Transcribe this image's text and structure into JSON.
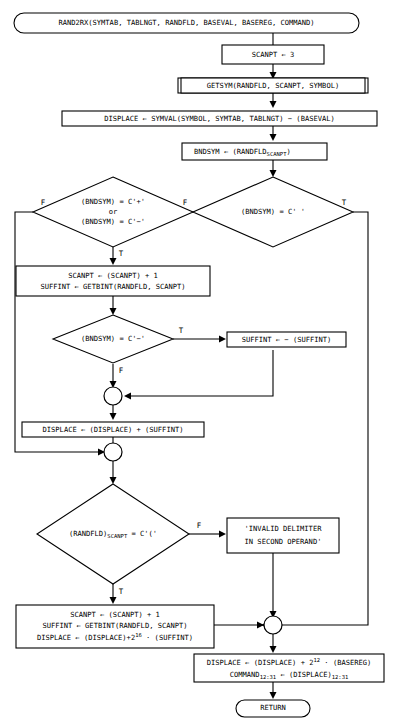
{
  "diagram": {
    "colors": {
      "stroke": "#000000",
      "fill": "#ffffff",
      "background": "#ffffff"
    }
  },
  "nodes": {
    "start": {
      "type": "terminator",
      "text": "RAND2RX(SYMTAB, TABLNGT, RANDFLD, BASEVAL, BASEREG, COMMAND)"
    },
    "scanpt_init": {
      "type": "process",
      "text": "SCANPT ← 3"
    },
    "getsym": {
      "type": "subroutine",
      "text": "GETSYM(RANDFLD, SCANPT, SYMBOL)"
    },
    "displace_symval": {
      "type": "process",
      "text": "DISPLACE ← SYMVAL(SYMBOL, SYMTAB, TABLNGT) − (BASEVAL)"
    },
    "bndsym_assign": {
      "type": "process",
      "text_main": "BNDSYM ← (RANDFLD",
      "text_sub": "SCANPT",
      "text_tail": ")"
    },
    "decision_blank": {
      "type": "decision",
      "text": "(BNDSYM) = C' '",
      "true_label": "T",
      "false_label": "F"
    },
    "decision_plusminus": {
      "type": "decision",
      "line1": "(BNDSYM) = C'+'",
      "line2": "or",
      "line3": "(BNDSYM) = C'−'",
      "true_label": "T",
      "false_label": "F"
    },
    "scanpt_suffint": {
      "type": "process",
      "line1": "SCANPT ← (SCANPT) + 1",
      "line2": "SUFFINT ← GETBINT(RANDFLD, SCANPT)"
    },
    "decision_minus": {
      "type": "decision",
      "text": "(BNDSYM) = C'−'",
      "true_label": "T",
      "false_label": "F"
    },
    "suffint_negate": {
      "type": "process",
      "text": "SUFFINT ← − (SUFFINT)"
    },
    "connector_1": {
      "type": "connector"
    },
    "displace_add_suffint": {
      "type": "process",
      "text": "DISPLACE ← (DISPLACE) + (SUFFINT)"
    },
    "connector_2": {
      "type": "connector"
    },
    "decision_paren": {
      "type": "decision",
      "text_main": "(RANDFLD)",
      "text_sub": "SCANPT",
      "text_tail": " = C'('",
      "true_label": "T",
      "false_label": "F"
    },
    "error_msg": {
      "type": "process",
      "line1": "'INVALID DELIMITER",
      "line2": "IN SECOND OPERAND'"
    },
    "scanpt_displace": {
      "type": "process",
      "line1": "SCANPT ← (SCANPT) + 1",
      "line2": "SUFFINT ← GETBINT(RANDFLD, SCANPT)",
      "line3_a": "DISPLACE ← (DISPLACE)+2",
      "line3_sup": "16",
      "line3_b": " · (SUFFINT)"
    },
    "connector_3": {
      "type": "connector"
    },
    "final_displace": {
      "type": "process",
      "line1_a": "DISPLACE ← (DISPLACE) + 2",
      "line1_sup": "12",
      "line1_b": " · (BASEREG)",
      "line2_a": "COMMAND",
      "line2_sub1": "12:31",
      "line2_b": " ← (DISPLACE)",
      "line2_sub2": "12:31"
    },
    "return": {
      "type": "terminator",
      "text": "RETURN"
    }
  },
  "edge_labels": {
    "blank_true": "T",
    "blank_false": "F",
    "plusminus_true": "T",
    "plusminus_false": "F",
    "minus_true": "T",
    "minus_false": "F",
    "paren_true": "T",
    "paren_false": "F"
  }
}
